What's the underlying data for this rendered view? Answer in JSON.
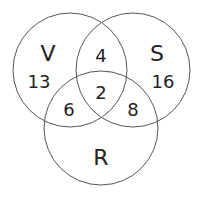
{
  "diagram": {
    "type": "venn",
    "sets": [
      {
        "name": "V",
        "cx": 70,
        "cy": 70,
        "r": 57
      },
      {
        "name": "S",
        "cx": 133,
        "cy": 70,
        "r": 57
      },
      {
        "name": "R",
        "cx": 101,
        "cy": 128,
        "r": 57
      }
    ],
    "regions": {
      "V_only": "13",
      "S_only": "16",
      "V_S_only": "4",
      "V_R_only": "6",
      "S_R_only": "8",
      "V_S_R": "2"
    },
    "line_color": "#444444"
  }
}
